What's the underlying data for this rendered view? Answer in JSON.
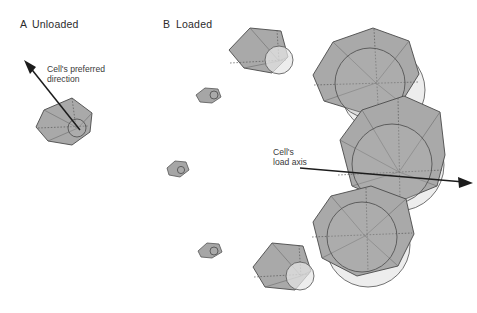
{
  "figure": {
    "background_color": "#ffffff",
    "width": 477,
    "height": 313,
    "cell_fill_color": "#a9a9a9",
    "cell_stroke_color": "#4a4a4a",
    "halo_fill_color": "#e6e6e6",
    "arrow_color": "#1c1c1c"
  },
  "panels": [
    {
      "letter": "A",
      "title": "Unloaded",
      "annotation_line1": "Cell's preferred",
      "annotation_line2": "direction",
      "arrow_name": "preferred-direction-arrow"
    },
    {
      "letter": "B",
      "title": "Loaded",
      "annotation_line1": "Cell's",
      "annotation_line2": "load axis",
      "arrow_name": "load-axis-arrow"
    }
  ]
}
